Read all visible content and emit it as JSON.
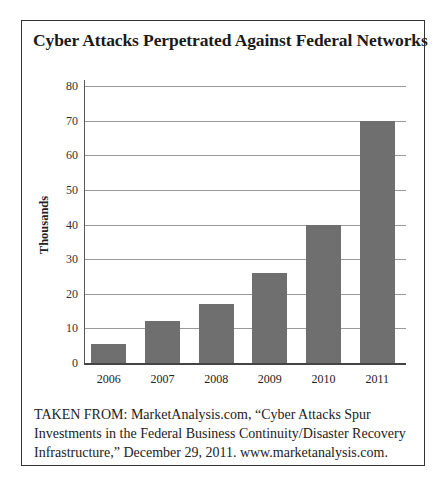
{
  "chart_data": {
    "type": "bar",
    "title": "Cyber Attacks Perpetrated Against Federal Networks",
    "categories": [
      "2006",
      "2007",
      "2008",
      "2009",
      "2010",
      "2011"
    ],
    "values": [
      5.5,
      12,
      17,
      26,
      40,
      70
    ],
    "xlabel": "",
    "ylabel": "Thousands",
    "ylim": [
      0,
      80
    ],
    "yticks": [
      "0",
      "10",
      "20",
      "30",
      "40",
      "50",
      "60",
      "70",
      "80"
    ],
    "grid": true,
    "legend": null,
    "bar_color": "#6f6f6f"
  },
  "source": {
    "lines": [
      "TAKEN FROM: MarketAnalysis.com, “Cyber Attacks Spur",
      "Investments in the Federal Business Continuity/Disaster Recovery",
      "Infrastructure,” December 29, 2011. www.marketanalysis.com."
    ]
  }
}
